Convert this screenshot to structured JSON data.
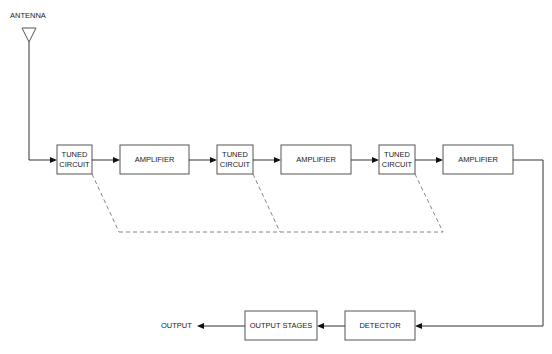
{
  "diagram": {
    "antenna_label": "ANTENNA",
    "output_label": "OUTPUT",
    "blocks": [
      {
        "id": "tuned1",
        "line1": "TUNED",
        "line2": "CIRCUIT"
      },
      {
        "id": "amp1",
        "line1": "AMPLIFIER"
      },
      {
        "id": "tuned2",
        "line1": "TUNED",
        "line2": "CIRCUIT"
      },
      {
        "id": "amp2",
        "line1": "AMPLIFIER"
      },
      {
        "id": "tuned3",
        "line1": "TUNED",
        "line2": "CIRCUIT"
      },
      {
        "id": "amp3",
        "line1": "AMPLIFIER"
      },
      {
        "id": "detector",
        "line1": "DETECTOR"
      },
      {
        "id": "output_stages",
        "line1": "OUTPUT STAGES"
      }
    ],
    "connections": [
      {
        "from": "antenna",
        "to": "tuned1",
        "style": "solid"
      },
      {
        "from": "tuned1",
        "to": "amp1",
        "style": "solid"
      },
      {
        "from": "amp1",
        "to": "tuned2",
        "style": "solid"
      },
      {
        "from": "tuned2",
        "to": "amp2",
        "style": "solid"
      },
      {
        "from": "amp2",
        "to": "tuned3",
        "style": "solid"
      },
      {
        "from": "tuned3",
        "to": "amp3",
        "style": "solid"
      },
      {
        "from": "amp3",
        "to": "detector",
        "style": "solid"
      },
      {
        "from": "detector",
        "to": "output_stages",
        "style": "solid"
      },
      {
        "from": "output_stages",
        "to": "output",
        "style": "solid"
      },
      {
        "from": "tuned1",
        "to": "tuned2",
        "style": "dashed-gang"
      },
      {
        "from": "tuned2",
        "to": "tuned3",
        "style": "dashed-gang"
      }
    ]
  }
}
